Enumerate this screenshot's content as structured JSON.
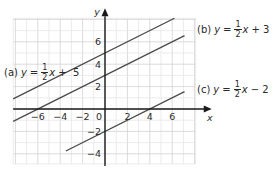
{
  "chart_data": {
    "type": "line",
    "title": "",
    "xlabel": "x",
    "ylabel": "y",
    "xlim": [
      -8.2,
      8.1
    ],
    "ylim": [
      -4.9,
      8.1
    ],
    "grid": true,
    "x_ticks": [
      -6,
      -4,
      -2,
      0,
      2,
      4,
      6
    ],
    "x_tick_labels": [
      "−6",
      "−4",
      "−2",
      "0",
      "2",
      "4",
      "6"
    ],
    "y_ticks": [
      6,
      4,
      2,
      -2,
      -4
    ],
    "y_tick_labels": [
      "6",
      "4",
      "2",
      "−2",
      "−4"
    ],
    "series": [
      {
        "name": "(a) y = 1/2 x + 5",
        "tag": "(a)",
        "slope": 0.5,
        "intercept": 5,
        "const_text": "+  5",
        "x_range": [
          -8.2,
          6.2
        ]
      },
      {
        "name": "(b) y = 1/2 x + 3",
        "tag": "(b)",
        "slope": 0.5,
        "intercept": 3,
        "const_text": "+ 3",
        "x_range": [
          -8.2,
          7.1
        ]
      },
      {
        "name": "(c) y = 1/2 x − 2",
        "tag": "(c)",
        "slope": 0.5,
        "intercept": -2,
        "const_text": "− 2",
        "x_range": [
          -3.5,
          7.1
        ]
      }
    ],
    "legend_position": "inline labels beside lines"
  },
  "labels": {
    "a": {
      "tag": "(a)",
      "var": "y",
      "eq": "=",
      "num": "1",
      "den": "2",
      "x": "x",
      "rest": "+  5"
    },
    "b": {
      "tag": "(b)",
      "var": "y",
      "eq": "=",
      "num": "1",
      "den": "2",
      "x": "x",
      "rest": "+ 3"
    },
    "c": {
      "tag": "(c)",
      "var": "y",
      "eq": "=",
      "num": "1",
      "den": "2",
      "x": "x",
      "rest": "− 2"
    }
  },
  "colors": {
    "grid_minor": "#e6e6e6",
    "grid_major": "#d2d2d2",
    "axis": "#1a1a1a",
    "line": "#4a4a4a",
    "text": "#2a2a2a"
  }
}
